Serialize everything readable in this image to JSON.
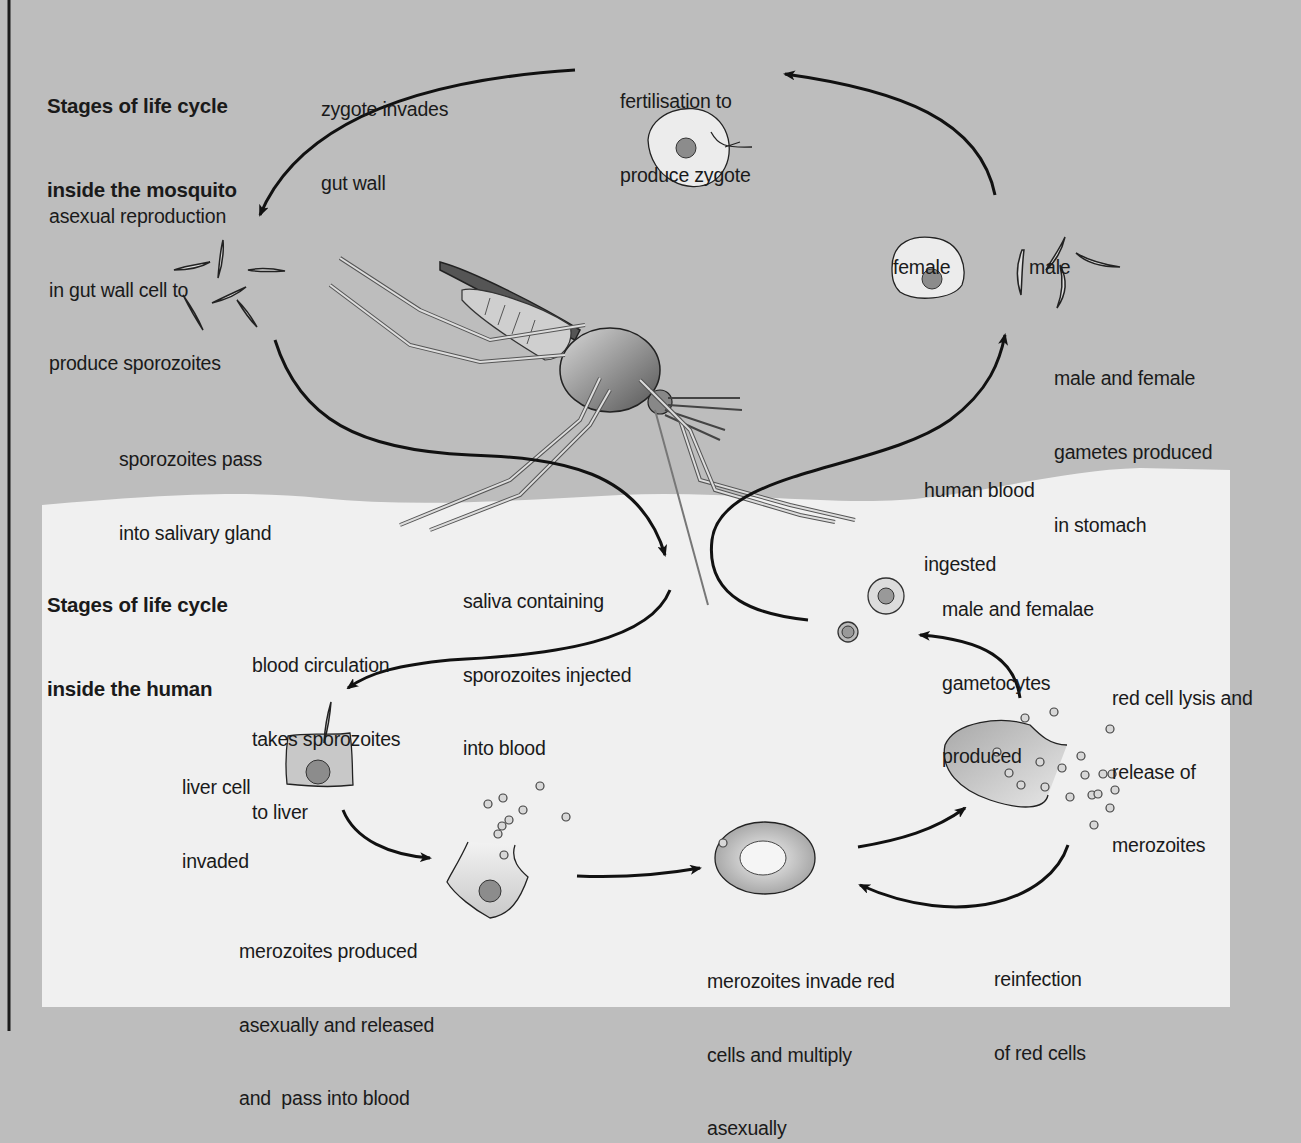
{
  "diagram": {
    "type": "life-cycle",
    "colors": {
      "mosquito_zone": "#bdbdbd",
      "human_zone": "#f0f0f0",
      "outer_border": "#1a1a1a",
      "arrow": "#111111",
      "cell_fill": "#e6e6e6",
      "nucleus_fill": "#8c8c8c"
    },
    "sections": {
      "mosquito": {
        "title": [
          "Stages of life cycle",
          "inside the mosquito"
        ]
      },
      "human": {
        "title": [
          "Stages of life cycle",
          "inside the human"
        ]
      }
    },
    "labels": {
      "zygote_invades": [
        "zygote invades",
        "gut wall"
      ],
      "fertilisation": [
        "fertilisation to",
        "produce zygote"
      ],
      "asexual_reproduction": [
        "asexual reproduction",
        "in gut wall cell to",
        "produce sporozoites"
      ],
      "female": [
        "female"
      ],
      "male": [
        "male"
      ],
      "gametes_produced": [
        "male and female",
        "gametes produced",
        "in stomach"
      ],
      "sporozoites_pass": [
        "sporozoites pass",
        "into salivary gland"
      ],
      "blood_ingested": [
        "human blood",
        "ingested"
      ],
      "saliva_injected": [
        "saliva containing",
        "sporozoites injected",
        "into blood"
      ],
      "gametocytes": [
        "male and femalae",
        "gametocytes",
        "produced"
      ],
      "blood_circulation": [
        "blood circulation",
        "takes sporozoites",
        "to liver"
      ],
      "red_cell_lysis": [
        "red cell lysis and",
        "release of",
        "merozoites"
      ],
      "liver_invaded": [
        "liver cell",
        "invaded"
      ],
      "merozoites_produced": [
        "merozoites produced",
        "asexually and released",
        "and  pass into blood"
      ],
      "merozoites_invade": [
        "merozoites invade red",
        "cells and multiply",
        "asexually"
      ],
      "reinfection": [
        "reinfection",
        "of red cells"
      ]
    },
    "flow": [
      "saliva containing sporozoites injected into blood",
      "blood circulation takes sporozoites to liver",
      "liver cell invaded",
      "merozoites produced asexually and released and pass into blood",
      "merozoites invade red cells and multiply asexually",
      "red cell lysis and release of merozoites",
      "reinfection of red cells",
      "male and femalae gametocytes produced",
      "human blood ingested",
      "male and female gametes produced in stomach",
      "fertilisation to produce zygote",
      "zygote invades gut wall",
      "asexual reproduction in gut wall cell to produce sporozoites",
      "sporozoites pass into salivary gland"
    ]
  }
}
